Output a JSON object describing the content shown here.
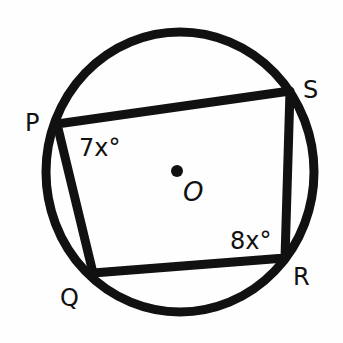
{
  "diagram": {
    "type": "inscribed-quadrilateral",
    "colors": {
      "stroke": "#111111",
      "background": "#ffffff"
    },
    "circle": {
      "center_label": "O",
      "cx": 180,
      "cy": 172,
      "rx": 134,
      "ry": 140
    },
    "vertices": [
      {
        "label": "P",
        "x": 57,
        "y": 124
      },
      {
        "label": "Q",
        "x": 93,
        "y": 273
      },
      {
        "label": "R",
        "x": 285,
        "y": 258
      },
      {
        "label": "S",
        "x": 290,
        "y": 91
      }
    ],
    "angles": [
      {
        "vertex": "P",
        "label": "7x°"
      },
      {
        "vertex": "R",
        "label": "8x°"
      }
    ]
  }
}
